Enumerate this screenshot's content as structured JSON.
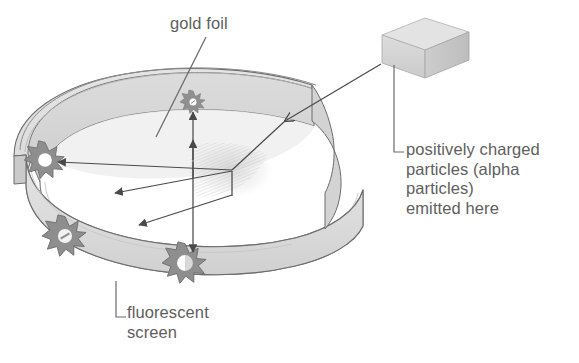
{
  "figure": {
    "background_color": "#ffffff",
    "text_color": "#5e5e5e",
    "line_color": "#4a4a4a",
    "ring_fill": "#d9d9d9",
    "ring_top_fill": "#cfcfcf",
    "ring_inner_fill": "#e6e6e6",
    "source_box_fill": "#d5d5d5",
    "source_box_top_fill": "#e2e2e2",
    "starburst_fill": "#9a9a9a",
    "starburst_core": "#ffffff"
  },
  "labels": {
    "gold_foil": "gold foil",
    "source": "positively charged\nparticles (alpha\nparticles)\nemitted here",
    "source_lines": [
      "positively charged",
      "particles (alpha",
      "particles)",
      "emitted here"
    ],
    "screen": "fluorescent\nscreen",
    "screen_lines": [
      "fluorescent",
      "screen"
    ]
  },
  "components": {
    "ring": "fluorescent-screen-ring",
    "foil": "gold-foil-sheet",
    "source": "alpha-particle-source-box",
    "scintillations": [
      {
        "name": "scintillation-back-wall",
        "x": 193,
        "y": 102
      },
      {
        "name": "scintillation-left-backscatter",
        "x": 45,
        "y": 160
      },
      {
        "name": "scintillation-left-lower",
        "x": 65,
        "y": 236
      },
      {
        "name": "scintillation-front-wall",
        "x": 185,
        "y": 263
      }
    ],
    "beams": [
      {
        "name": "incoming-beam",
        "from": "source",
        "to": "gold-foil"
      },
      {
        "name": "scattered-beam-backward-left",
        "to": "scintillation-left-backscatter"
      },
      {
        "name": "scattered-beam-lower-left",
        "to": "scintillation-left-lower"
      },
      {
        "name": "undeflected-beam-up",
        "to": "scintillation-back-wall"
      },
      {
        "name": "deflected-beam-down",
        "to": "scintillation-front-wall"
      }
    ]
  }
}
